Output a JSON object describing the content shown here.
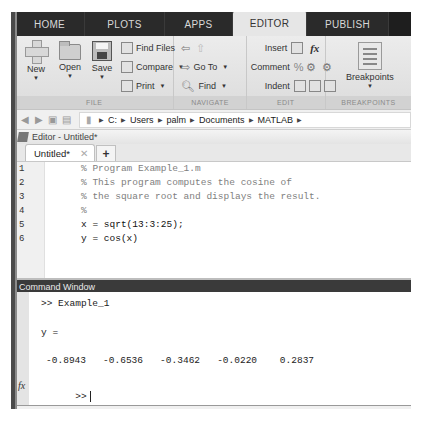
{
  "ribbon": {
    "tabs": [
      {
        "label": "HOME",
        "active": false
      },
      {
        "label": "PLOTS",
        "active": false
      },
      {
        "label": "APPS",
        "active": false
      },
      {
        "label": "EDITOR",
        "active": true
      },
      {
        "label": "PUBLISH",
        "active": false
      }
    ],
    "groups": {
      "file": {
        "label": "FILE",
        "new": "New",
        "open": "Open",
        "save": "Save",
        "find_files": "Find Files",
        "compare": "Compare",
        "print": "Print"
      },
      "navigate": {
        "label": "NAVIGATE",
        "go_to": "Go To",
        "find": "Find"
      },
      "edit": {
        "label": "EDIT",
        "insert": "Insert",
        "comment": "Comment",
        "indent": "Indent",
        "fx": "fx",
        "percent": "%"
      },
      "breakpoints": {
        "label": "BREAKPOINTS",
        "button": "Breakpoints"
      }
    }
  },
  "address_bar": {
    "path": [
      "C:",
      "Users",
      "palm",
      "Documents",
      "MATLAB"
    ]
  },
  "editor": {
    "title": "Editor - Untitled*",
    "tab_label": "Untitled*",
    "close_glyph": "✕",
    "add_tab_glyph": "+",
    "lines": [
      {
        "num": "1",
        "text": "% Program Example_1.m",
        "type": "comment"
      },
      {
        "num": "2",
        "text": "% This program computes the cosine of",
        "type": "comment"
      },
      {
        "num": "3",
        "text": "% the square root and displays the result.",
        "type": "comment"
      },
      {
        "num": "4",
        "text": "%",
        "type": "comment"
      },
      {
        "num": "5",
        "text": "x = sqrt(13:3:25);",
        "type": "code"
      },
      {
        "num": "6",
        "text": "y = cos(x)",
        "type": "code"
      }
    ]
  },
  "command_window": {
    "title": "Command Window",
    "command": ">> Example_1",
    "output_var": "y =",
    "values": [
      "-0.8943",
      "-0.6536",
      "-0.3462",
      "-0.0220",
      "0.2837"
    ],
    "values_line": "   -0.8943   -0.6536   -0.3462   -0.0220    0.2837",
    "fx_label": "fx",
    "prompt": ">>"
  }
}
